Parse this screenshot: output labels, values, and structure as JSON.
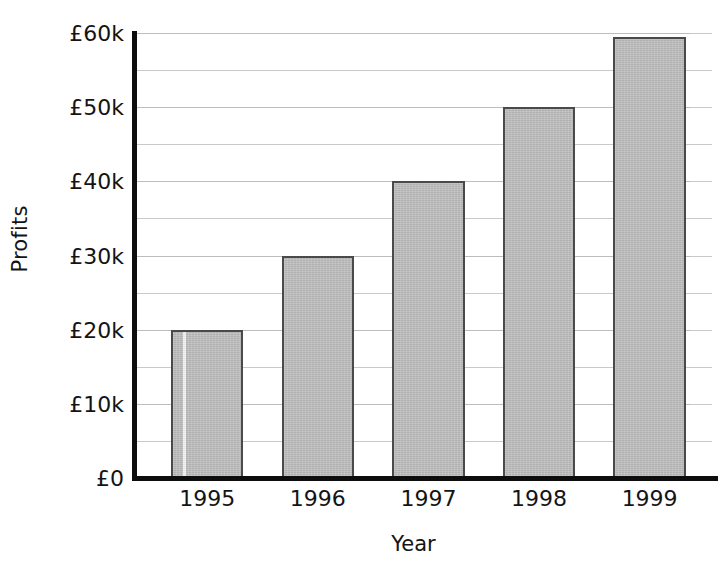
{
  "chart_data": {
    "type": "bar",
    "title": "",
    "subtitle": "",
    "xlabel": "Year",
    "ylabel": "Profits",
    "categories": [
      "1995",
      "1996",
      "1997",
      "1998",
      "1999"
    ],
    "values": [
      20000,
      30000,
      40000,
      50000,
      59500
    ],
    "value_labels": [
      "£20k",
      "£30k",
      "£40k",
      "£50k",
      "£59.5k"
    ],
    "ylim": [
      0,
      60000
    ],
    "y_major_ticks": [
      0,
      10000,
      20000,
      30000,
      40000,
      50000,
      60000
    ],
    "y_major_tick_labels": [
      "£0",
      "£10k",
      "£20k",
      "£30k",
      "£40k",
      "£50k",
      "£60k"
    ],
    "y_minor_ticks": [
      5000,
      15000,
      25000,
      35000,
      45000,
      55000
    ],
    "grid": "horizontal",
    "legend": "none",
    "series": [
      {
        "name": "Profits",
        "values": [
          20000,
          30000,
          40000,
          50000,
          59500
        ]
      }
    ],
    "colors": {
      "bar_fill": "#b7b7b7",
      "bar_edge": "#4a4a4a",
      "gridline": "#c9c9c9",
      "axis": "#0d0d0d",
      "text": "#141414",
      "background": "#ffffff"
    }
  }
}
